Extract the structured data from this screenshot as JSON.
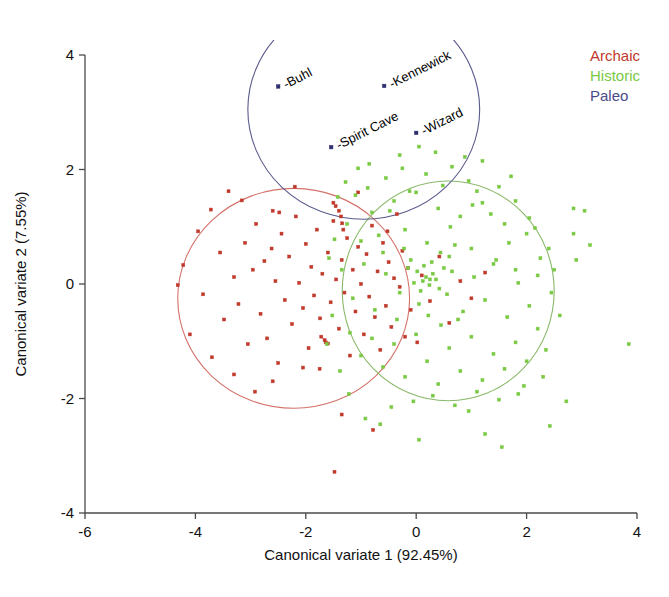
{
  "figure": {
    "background": "#ffffff",
    "width": 669,
    "height": 597
  },
  "legend": {
    "position": "top-right",
    "entries": [
      {
        "label": "Archaic",
        "color": "#c0392b"
      },
      {
        "label": "Historic",
        "color": "#7ac943"
      },
      {
        "label": "Paleo",
        "color": "#4a4a8a"
      }
    ]
  },
  "chart_data": {
    "type": "scatter",
    "title": "",
    "subtitle": "",
    "xlabel": "Canonical variate 1 (92.45%)",
    "ylabel": "Canonical variate 2 (7.55%)",
    "xlim": [
      -6,
      4
    ],
    "ylim": [
      -4,
      4
    ],
    "xticks": [
      -6,
      -4,
      -2,
      0,
      2,
      4
    ],
    "yticks": [
      -4,
      -2,
      0,
      2,
      4
    ],
    "xtick_labels": [
      "-6",
      "-4",
      "-2",
      "0",
      "2",
      "4"
    ],
    "ytick_labels": [
      "-4",
      "-2",
      "0",
      "2",
      "4"
    ],
    "grid": false,
    "legend_position": "top-right",
    "series": [
      {
        "name": "Archaic",
        "color": "#c0392b",
        "marker": "square",
        "marker_size": 3,
        "points": [
          [
            -4.22,
            0.33
          ],
          [
            -3.95,
            0.92
          ],
          [
            -3.86,
            -0.18
          ],
          [
            -3.72,
            1.3
          ],
          [
            -3.55,
            0.55
          ],
          [
            -3.48,
            -0.62
          ],
          [
            -3.4,
            1.62
          ],
          [
            -3.3,
            0.12
          ],
          [
            -3.22,
            -0.35
          ],
          [
            -3.1,
            0.72
          ],
          [
            -3.05,
            -1.05
          ],
          [
            -2.96,
            0.25
          ],
          [
            -2.9,
            1.05
          ],
          [
            -2.82,
            -0.52
          ],
          [
            -2.75,
            0.4
          ],
          [
            -2.7,
            -0.95
          ],
          [
            -2.62,
            0.62
          ],
          [
            -2.55,
            0.05
          ],
          [
            -2.5,
            -1.38
          ],
          [
            -2.44,
            0.88
          ],
          [
            -2.38,
            -0.28
          ],
          [
            -2.3,
            0.48
          ],
          [
            -2.25,
            -0.7
          ],
          [
            -2.18,
            1.18
          ],
          [
            -2.12,
            0.02
          ],
          [
            -2.05,
            -0.42
          ],
          [
            -2.0,
            0.7
          ],
          [
            -1.95,
            -1.12
          ],
          [
            -1.9,
            0.3
          ],
          [
            -1.85,
            -0.2
          ],
          [
            -1.8,
            0.95
          ],
          [
            -1.74,
            -0.6
          ],
          [
            -1.7,
            0.18
          ],
          [
            -1.64,
            -1.02
          ],
          [
            -1.6,
            0.55
          ],
          [
            -1.55,
            -0.32
          ],
          [
            -1.5,
            1.1
          ],
          [
            -1.45,
            0.08
          ],
          [
            -1.4,
            -0.78
          ],
          [
            -1.35,
            0.42
          ],
          [
            -1.3,
            -0.15
          ],
          [
            -1.25,
            0.8
          ],
          [
            -1.2,
            -1.25
          ],
          [
            -1.15,
            0.25
          ],
          [
            -1.1,
            -0.48
          ],
          [
            -1.05,
            0.65
          ],
          [
            -1.0,
            0.0
          ],
          [
            -0.95,
            -0.88
          ],
          [
            -0.9,
            0.52
          ],
          [
            -0.85,
            -0.22
          ],
          [
            -0.8,
            1.02
          ],
          [
            -0.75,
            -0.58
          ],
          [
            -0.7,
            0.22
          ],
          [
            -0.65,
            -1.15
          ],
          [
            -0.6,
            0.72
          ],
          [
            -0.55,
            -0.38
          ],
          [
            -0.5,
            0.38
          ],
          [
            -0.45,
            -0.75
          ],
          [
            -0.4,
            0.1
          ],
          [
            -0.35,
            1.22
          ],
          [
            -0.3,
            -0.05
          ],
          [
            -0.25,
            0.58
          ],
          [
            -0.2,
            -0.92
          ],
          [
            -0.15,
            0.28
          ],
          [
            -0.1,
            -0.45
          ],
          [
            0.1,
            0.15
          ],
          [
            0.25,
            -0.3
          ],
          [
            0.42,
            0.48
          ],
          [
            0.6,
            -0.68
          ],
          [
            0.8,
            0.05
          ],
          [
            1.0,
            -0.25
          ],
          [
            1.25,
            0.2
          ],
          [
            -1.46,
            1.36
          ],
          [
            -1.4,
            1.28
          ],
          [
            -1.36,
            1.18
          ],
          [
            -1.34,
            1.06
          ],
          [
            -1.32,
            0.95
          ],
          [
            -1.5,
            1.42
          ],
          [
            -2.6,
            1.28
          ],
          [
            -2.48,
            1.25
          ],
          [
            -1.72,
            -0.92
          ],
          [
            -1.66,
            -0.98
          ],
          [
            -1.6,
            -1.04
          ],
          [
            -3.3,
            -1.58
          ],
          [
            -2.6,
            -1.7
          ],
          [
            -2.05,
            -1.46
          ],
          [
            -1.75,
            -1.48
          ],
          [
            -4.32,
            -0.02
          ],
          [
            -4.1,
            -0.88
          ],
          [
            -3.7,
            -1.28
          ],
          [
            -3.16,
            1.46
          ],
          [
            -2.2,
            1.7
          ],
          [
            -1.05,
            1.6
          ],
          [
            -0.52,
            0.92
          ],
          [
            0.02,
            -1.02
          ],
          [
            -2.92,
            -1.88
          ],
          [
            -1.35,
            -2.28
          ],
          [
            -0.78,
            -2.55
          ],
          [
            -1.48,
            -3.28
          ]
        ]
      },
      {
        "name": "Historic",
        "color": "#7ac943",
        "marker": "square",
        "marker_size": 3,
        "points": [
          [
            -1.1,
            1.55
          ],
          [
            -0.85,
            2.1
          ],
          [
            -0.55,
            1.85
          ],
          [
            -0.3,
            2.25
          ],
          [
            0.05,
            2.4
          ],
          [
            0.35,
            2.3
          ],
          [
            0.65,
            2.05
          ],
          [
            0.95,
            1.8
          ],
          [
            1.2,
            2.15
          ],
          [
            1.5,
            1.7
          ],
          [
            1.8,
            1.45
          ],
          [
            2.05,
            1.15
          ],
          [
            -1.25,
            1.05
          ],
          [
            -1.0,
            0.75
          ],
          [
            -0.8,
            1.25
          ],
          [
            -0.6,
            0.55
          ],
          [
            -0.4,
            1.45
          ],
          [
            -0.2,
            0.95
          ],
          [
            0.0,
            1.6
          ],
          [
            0.2,
            0.72
          ],
          [
            0.4,
            1.32
          ],
          [
            0.6,
            0.48
          ],
          [
            0.8,
            1.18
          ],
          [
            1.0,
            0.62
          ],
          [
            1.2,
            1.42
          ],
          [
            1.4,
            0.35
          ],
          [
            1.6,
            1.05
          ],
          [
            1.8,
            0.25
          ],
          [
            2.0,
            0.88
          ],
          [
            2.2,
            0.15
          ],
          [
            2.4,
            0.62
          ],
          [
            -1.35,
            0.25
          ],
          [
            -1.15,
            -0.25
          ],
          [
            -0.95,
            0.35
          ],
          [
            -0.75,
            -0.45
          ],
          [
            -0.55,
            0.18
          ],
          [
            -0.35,
            -0.62
          ],
          [
            -0.15,
            0.28
          ],
          [
            0.05,
            -0.35
          ],
          [
            0.25,
            0.08
          ],
          [
            0.45,
            -0.72
          ],
          [
            0.65,
            0.22
          ],
          [
            0.85,
            -0.48
          ],
          [
            1.05,
            0.12
          ],
          [
            1.25,
            -0.28
          ],
          [
            1.45,
            0.42
          ],
          [
            1.65,
            -0.58
          ],
          [
            1.85,
            0.02
          ],
          [
            2.05,
            -0.38
          ],
          [
            2.25,
            0.45
          ],
          [
            2.45,
            -0.15
          ],
          [
            -1.2,
            -0.85
          ],
          [
            -1.0,
            -1.25
          ],
          [
            -0.8,
            -0.95
          ],
          [
            -0.6,
            -1.45
          ],
          [
            -0.4,
            -1.05
          ],
          [
            -0.2,
            -1.62
          ],
          [
            0.0,
            -0.88
          ],
          [
            0.2,
            -1.35
          ],
          [
            0.4,
            -1.75
          ],
          [
            0.6,
            -1.12
          ],
          [
            0.8,
            -1.52
          ],
          [
            1.0,
            -0.92
          ],
          [
            1.2,
            -1.68
          ],
          [
            1.4,
            -1.22
          ],
          [
            1.6,
            -1.48
          ],
          [
            1.8,
            -1.02
          ],
          [
            2.0,
            -1.35
          ],
          [
            2.2,
            -0.78
          ],
          [
            2.35,
            -1.15
          ],
          [
            -0.05,
            -2.05
          ],
          [
            0.3,
            -1.95
          ],
          [
            0.7,
            -2.12
          ],
          [
            1.1,
            -1.88
          ],
          [
            1.5,
            -2.02
          ],
          [
            -0.45,
            -2.15
          ],
          [
            0.95,
            -2.22
          ],
          [
            1.85,
            -1.92
          ],
          [
            0.12,
            0.05
          ],
          [
            0.18,
            0.12
          ],
          [
            0.24,
            -0.02
          ],
          [
            0.3,
            0.18
          ],
          [
            0.08,
            -0.12
          ],
          [
            0.02,
            0.22
          ],
          [
            -0.04,
            0.02
          ],
          [
            0.36,
            0.08
          ],
          [
            0.42,
            -0.08
          ],
          [
            0.14,
            0.32
          ],
          [
            0.28,
            0.38
          ],
          [
            -0.1,
            0.42
          ],
          [
            0.5,
            0.28
          ],
          [
            0.56,
            -0.18
          ],
          [
            0.22,
            -0.55
          ],
          [
            0.44,
            0.55
          ],
          [
            -0.22,
            0.62
          ],
          [
            -0.3,
            -0.15
          ],
          [
            0.7,
            0.68
          ],
          [
            0.76,
            -0.62
          ],
          [
            0.62,
            1.0
          ],
          [
            -0.68,
            0.85
          ],
          [
            -0.88,
            1.68
          ],
          [
            -0.48,
            1.28
          ],
          [
            1.1,
            1.62
          ],
          [
            1.35,
            1.22
          ],
          [
            1.68,
            0.72
          ],
          [
            2.15,
            0.98
          ],
          [
            2.5,
            0.25
          ],
          [
            2.6,
            -0.55
          ],
          [
            2.3,
            -1.62
          ],
          [
            1.95,
            -1.78
          ],
          [
            -1.42,
            1.52
          ],
          [
            -1.28,
            1.78
          ],
          [
            -1.05,
            2.02
          ],
          [
            2.85,
            1.32
          ],
          [
            3.05,
            1.28
          ],
          [
            2.85,
            0.88
          ],
          [
            2.9,
            0.42
          ],
          [
            3.15,
            0.68
          ],
          [
            3.85,
            -1.05
          ],
          [
            2.72,
            -2.05
          ],
          [
            2.42,
            -2.48
          ],
          [
            1.25,
            -2.62
          ],
          [
            0.05,
            -2.72
          ],
          [
            -0.65,
            -2.45
          ],
          [
            1.55,
            -2.85
          ],
          [
            -1.58,
            0.45
          ],
          [
            -1.52,
            -0.55
          ],
          [
            -1.48,
            0.78
          ],
          [
            -1.62,
            -1.05
          ],
          [
            -1.38,
            -1.52
          ],
          [
            -1.22,
            -1.92
          ],
          [
            -0.92,
            -2.35
          ],
          [
            0.48,
            1.72
          ],
          [
            0.18,
            1.92
          ],
          [
            -0.12,
            1.62
          ],
          [
            1.02,
            1.38
          ],
          [
            1.72,
            1.88
          ],
          [
            0.88,
            2.22
          ],
          [
            -0.25,
            2.02
          ]
        ]
      },
      {
        "name": "Paleo",
        "color": "#2e2e6e",
        "marker": "square",
        "marker_size": 3,
        "labeled": true,
        "points": [
          {
            "label": "Buhl",
            "x": -2.5,
            "y": 3.45
          },
          {
            "label": "Kennewick",
            "x": -0.58,
            "y": 3.46
          },
          {
            "label": "Spirit Cave",
            "x": -1.54,
            "y": 2.39
          },
          {
            "label": "Wizard",
            "x": 0.0,
            "y": 2.64
          }
        ]
      }
    ],
    "confidence_ellipses": [
      {
        "name": "Archaic-ellipse",
        "color": "#d4726a",
        "cx": -2.22,
        "cy": -0.25,
        "rx": 2.1,
        "ry": 1.92
      },
      {
        "name": "Historic-ellipse",
        "color": "#8ab96a",
        "cx": 0.58,
        "cy": -0.12,
        "rx": 1.92,
        "ry": 1.92
      },
      {
        "name": "Paleo-ellipse",
        "color": "#5a5a8c",
        "cx": -0.95,
        "cy": 3.05,
        "rx": 2.1,
        "ry": 1.92
      }
    ]
  }
}
